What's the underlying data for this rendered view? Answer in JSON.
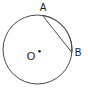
{
  "figure": {
    "type": "circle-with-shaded-segment",
    "labels": {
      "point_top": "A",
      "point_right": "B",
      "center": "O"
    },
    "colors": {
      "segment_fill": "#bfbfbf",
      "line": "#4a4a4a",
      "label_text": "#1a1a1a",
      "background": "#ffffff"
    }
  }
}
